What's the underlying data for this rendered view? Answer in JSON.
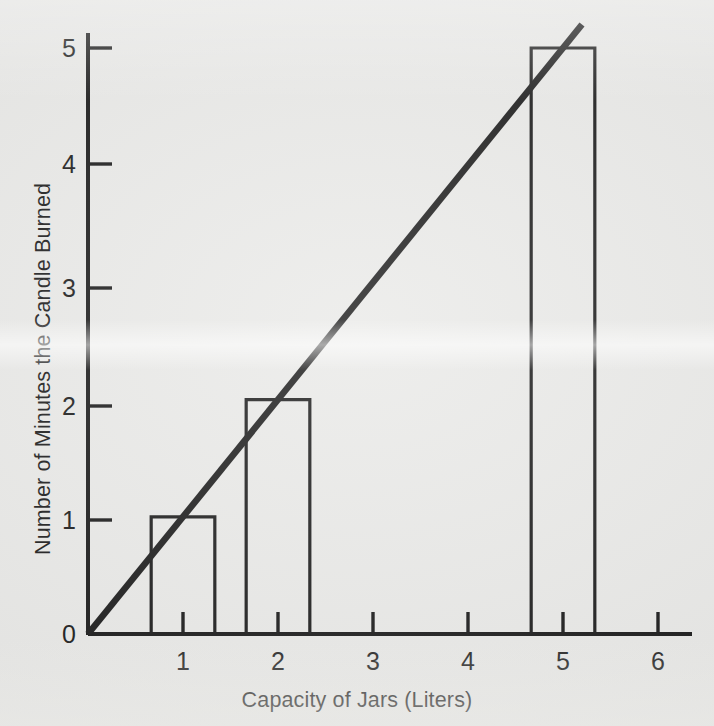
{
  "chart_data": {
    "type": "bar",
    "title": "",
    "subtitle": "",
    "xlabel": "Capacity of Jars (Liters)",
    "ylabel": "Number of Minutes the Candle Burned",
    "categories": [
      "1",
      "2",
      "5"
    ],
    "x": [
      1,
      2,
      5
    ],
    "values": [
      1,
      2,
      5
    ],
    "bar_half_width": 0.335,
    "xlim": [
      0,
      6.35
    ],
    "ylim": [
      0,
      5.5
    ],
    "xticks": [
      1,
      2,
      3,
      4,
      5,
      6
    ],
    "xtick_labels": [
      "1",
      "2",
      "3",
      "4",
      "5",
      "6"
    ],
    "yticks": [
      0,
      1,
      2,
      3,
      4,
      5
    ],
    "ytick_labels": [
      "0",
      "1",
      "2",
      "3",
      "4",
      "5"
    ],
    "grid": false,
    "legend": false,
    "legend_position": "none",
    "series": [
      {
        "name": "Minutes the candle burned",
        "type": "bar",
        "categories": [
          "1",
          "2",
          "5"
        ],
        "values": [
          1,
          2,
          5
        ]
      },
      {
        "name": "Trend line",
        "type": "line",
        "points": [
          [
            0,
            0
          ],
          [
            5.2,
            5.2
          ]
        ],
        "slope": 1,
        "intercept": 0
      }
    ],
    "annotations": [],
    "colors": {
      "background": "#e9e9e7",
      "ink": "#141414",
      "bar_fill": "none",
      "bar_stroke": "#141414",
      "line_stroke": "#141414"
    }
  },
  "figure": {
    "axis_ticks_direction": "inward",
    "bar_style": "outline-only"
  }
}
